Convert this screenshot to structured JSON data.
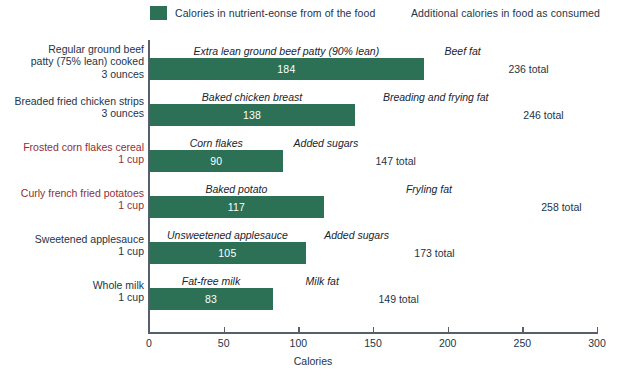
{
  "legend": {
    "items": [
      {
        "label": "Calories in nutrient-eonse from of the food",
        "color": "#2c7155",
        "icon": "legend-swatch-dark-green"
      },
      {
        "label": "Additional calories in food as consumed",
        "color": "#a4c council",
        "icon": "legend-swatch-light-green"
      }
    ]
  },
  "colors": {
    "base": "#2c7155",
    "additional": "#a6c council",
    "axis": "#56606b",
    "text": "#1d3448",
    "highlight": "#8e2f35"
  },
  "chart_data": {
    "type": "bar",
    "orientation": "horizontal",
    "stacked": true,
    "title": "",
    "xlabel": "Calories",
    "ylabel": "",
    "xlim": [
      0,
      300
    ],
    "xticks": [
      0,
      50,
      100,
      150,
      200,
      250,
      300
    ],
    "grid": false,
    "legend_position": "top",
    "series": [
      {
        "name": "Calories in nutrient-eonse from of the food",
        "color": "#2c7155",
        "values": [
          184,
          138,
          90,
          117,
          105,
          83
        ]
      },
      {
        "name": "Additional calories in food as consumed",
        "color": "#a6c council",
        "values": [
          52,
          108,
          57,
          141,
          68,
          66
        ]
      }
    ],
    "categories": [
      "Regular ground beef patty (75% lean) cooked 3 ounces",
      "Breaded fried chicken strips 3 ounces",
      "Frosted corn flakes cereal 1 cup",
      "Curly french fried potatoes 1 cup",
      "Sweetened applesauce 1 cup",
      "Whole milk 1 cup"
    ],
    "rows": [
      {
        "label_lines": [
          "Regular ground beef",
          "patty (75% lean) cooked",
          "3 ounces"
        ],
        "highlight": false,
        "base_caption": "Extra lean ground beef patty (90% lean)",
        "base_value": 184,
        "extra_caption": "Beef fat",
        "extra_value": 52,
        "total_label": "236 total",
        "total_value": 236
      },
      {
        "label_lines": [
          "Breaded fried chicken strips",
          "3 ounces"
        ],
        "highlight": false,
        "base_caption": "Baked chicken breast",
        "base_value": 138,
        "extra_caption": "Breading and frying fat",
        "extra_value": 108,
        "total_label": "246 total",
        "total_value": 246
      },
      {
        "label_lines": [
          "Frosted corn flakes cereal",
          "1 cup"
        ],
        "highlight": true,
        "base_caption": "Corn flakes",
        "base_value": 90,
        "extra_caption": "Added sugars",
        "extra_value": 57,
        "total_label": "147 total",
        "total_value": 147
      },
      {
        "label_lines": [
          "Curly french fried potatoes",
          "1 cup"
        ],
        "highlight": true,
        "base_caption": "Baked potato",
        "base_value": 117,
        "extra_caption": "Fryling fat",
        "extra_value": 141,
        "total_label": "258 total",
        "total_value": 258
      },
      {
        "label_lines": [
          "Sweetened applesauce",
          "1 cup"
        ],
        "highlight": false,
        "base_caption": "Unsweetened applesauce",
        "base_value": 105,
        "extra_caption": "Added sugars",
        "extra_value": 68,
        "total_label": "173 total",
        "total_value": 173
      },
      {
        "label_lines": [
          "Whole milk",
          "1 cup"
        ],
        "highlight": false,
        "base_caption": "Fat-free milk",
        "base_value": 83,
        "extra_caption": "Milk fat",
        "extra_value": 66,
        "total_label": "149 total",
        "total_value": 149
      }
    ]
  }
}
